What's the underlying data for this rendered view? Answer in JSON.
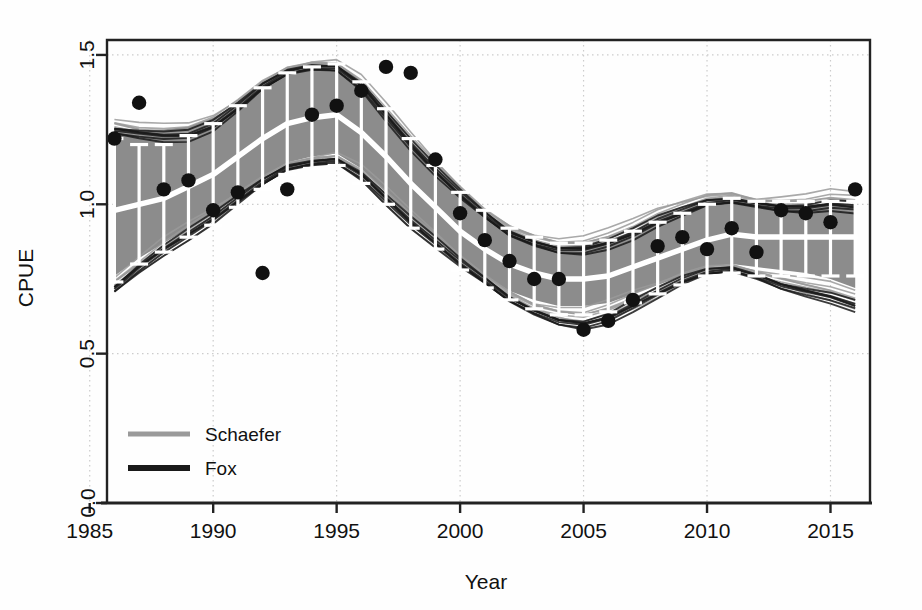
{
  "chart_data": {
    "type": "line",
    "title": "",
    "xlabel": "Year",
    "ylabel": "CPUE",
    "xlim": [
      1985.7,
      2016.6
    ],
    "ylim": [
      0.0,
      1.55
    ],
    "xticks": [
      1985,
      1990,
      1995,
      2000,
      2005,
      2010,
      2015
    ],
    "xticklabels": [
      "1985",
      "1990",
      "1995",
      "2000",
      "2005",
      "2010",
      "2015"
    ],
    "yticks": [
      0.0,
      0.5,
      1.0,
      1.5
    ],
    "yticklabels": [
      "0.0",
      "0.5",
      "1.0",
      "1.5"
    ],
    "grid": true,
    "grid_style": "dotted",
    "legend": {
      "position": "bottom-left",
      "entries": [
        {
          "label": "Schaefer",
          "color": "#9a9a9a"
        },
        {
          "label": "Fox",
          "color": "#1a1a1a"
        }
      ]
    },
    "colors": {
      "ribbon": "#8c8c8c",
      "median_line": "#ffffff",
      "errorbar": "#ffffff",
      "observed_points": "#111111",
      "schaefer": "#9a9a9a",
      "fox": "#1a1a1a",
      "axis": "#222222",
      "grid": "#cccccc"
    },
    "x": [
      1986,
      1987,
      1988,
      1989,
      1990,
      1991,
      1992,
      1993,
      1994,
      1995,
      1996,
      1997,
      1998,
      1999,
      2000,
      2001,
      2002,
      2003,
      2004,
      2005,
      2006,
      2007,
      2008,
      2009,
      2010,
      2011,
      2012,
      2013,
      2014,
      2015,
      2016
    ],
    "series": [
      {
        "name": "median",
        "role": "fitted-median",
        "values": [
          0.98,
          1.0,
          1.02,
          1.06,
          1.1,
          1.16,
          1.22,
          1.27,
          1.29,
          1.3,
          1.24,
          1.16,
          1.07,
          0.99,
          0.91,
          0.85,
          0.8,
          0.77,
          0.75,
          0.75,
          0.76,
          0.79,
          0.82,
          0.85,
          0.88,
          0.9,
          0.89,
          0.89,
          0.89,
          0.89,
          0.89
        ]
      },
      {
        "name": "ribbon_lower",
        "role": "ci-lower",
        "values": [
          0.76,
          0.82,
          0.87,
          0.92,
          0.97,
          1.03,
          1.09,
          1.14,
          1.16,
          1.17,
          1.12,
          1.04,
          0.96,
          0.89,
          0.82,
          0.76,
          0.71,
          0.68,
          0.66,
          0.66,
          0.67,
          0.7,
          0.73,
          0.76,
          0.79,
          0.8,
          0.79,
          0.78,
          0.77,
          0.75,
          0.72
        ]
      },
      {
        "name": "ribbon_upper",
        "role": "ci-upper",
        "values": [
          1.25,
          1.25,
          1.25,
          1.26,
          1.29,
          1.34,
          1.4,
          1.45,
          1.46,
          1.46,
          1.4,
          1.3,
          1.2,
          1.11,
          1.03,
          0.96,
          0.91,
          0.88,
          0.86,
          0.86,
          0.88,
          0.91,
          0.95,
          0.98,
          1.01,
          1.02,
          1.01,
          1.0,
          1.0,
          1.0,
          0.99
        ]
      },
      {
        "name": "Schaefer",
        "role": "model-envelope",
        "values": [
          1.27,
          1.25,
          1.24,
          1.24,
          1.27,
          1.33,
          1.4,
          1.45,
          1.47,
          1.47,
          1.41,
          1.31,
          1.21,
          1.12,
          1.04,
          0.97,
          0.92,
          0.89,
          0.87,
          0.87,
          0.89,
          0.92,
          0.96,
          0.99,
          1.02,
          1.03,
          1.01,
          1.01,
          1.01,
          1.02,
          1.01
        ]
      },
      {
        "name": "Fox",
        "role": "model-envelope",
        "values": [
          1.25,
          1.24,
          1.23,
          1.23,
          1.26,
          1.32,
          1.39,
          1.44,
          1.46,
          1.46,
          1.4,
          1.3,
          1.2,
          1.11,
          1.03,
          0.96,
          0.9,
          0.87,
          0.85,
          0.85,
          0.87,
          0.9,
          0.94,
          0.97,
          1.0,
          1.01,
          1.0,
          0.99,
          0.99,
          1.0,
          0.99
        ]
      },
      {
        "name": "Schaefer_lower",
        "role": "model-envelope-lower",
        "values": [
          0.74,
          0.8,
          0.86,
          0.91,
          0.96,
          1.02,
          1.08,
          1.13,
          1.15,
          1.16,
          1.11,
          1.03,
          0.95,
          0.88,
          0.81,
          0.75,
          0.7,
          0.66,
          0.64,
          0.63,
          0.65,
          0.68,
          0.71,
          0.75,
          0.78,
          0.79,
          0.77,
          0.75,
          0.73,
          0.71,
          0.68
        ]
      },
      {
        "name": "Fox_lower",
        "role": "model-envelope-lower",
        "values": [
          0.72,
          0.79,
          0.85,
          0.9,
          0.95,
          1.01,
          1.07,
          1.12,
          1.14,
          1.15,
          1.1,
          1.02,
          0.94,
          0.87,
          0.8,
          0.74,
          0.68,
          0.64,
          0.61,
          0.6,
          0.62,
          0.66,
          0.7,
          0.74,
          0.77,
          0.78,
          0.76,
          0.73,
          0.71,
          0.69,
          0.66
        ]
      }
    ],
    "errorbars": {
      "name": "median-with-95CI",
      "x": [
        1986,
        1987,
        1988,
        1989,
        1990,
        1991,
        1992,
        1993,
        1994,
        1995,
        1996,
        1997,
        1998,
        1999,
        2000,
        2001,
        2002,
        2003,
        2004,
        2005,
        2006,
        2007,
        2008,
        2009,
        2010,
        2011,
        2012,
        2013,
        2014,
        2015,
        2016
      ],
      "center": [
        0.98,
        1.0,
        1.02,
        1.06,
        1.1,
        1.16,
        1.22,
        1.27,
        1.29,
        1.3,
        1.24,
        1.16,
        1.07,
        0.99,
        0.91,
        0.85,
        0.8,
        0.77,
        0.75,
        0.75,
        0.76,
        0.79,
        0.82,
        0.85,
        0.88,
        0.9,
        0.89,
        0.89,
        0.89,
        0.89,
        0.89
      ],
      "lower": [
        0.74,
        0.8,
        0.84,
        0.89,
        0.93,
        0.99,
        1.05,
        1.1,
        1.12,
        1.13,
        1.07,
        1.0,
        0.92,
        0.85,
        0.78,
        0.72,
        0.68,
        0.65,
        0.63,
        0.63,
        0.64,
        0.67,
        0.7,
        0.73,
        0.76,
        0.77,
        0.76,
        0.76,
        0.76,
        0.76,
        0.76
      ],
      "upper": [
        1.22,
        1.2,
        1.2,
        1.23,
        1.27,
        1.33,
        1.39,
        1.44,
        1.46,
        1.47,
        1.41,
        1.32,
        1.22,
        1.13,
        1.04,
        0.98,
        0.92,
        0.89,
        0.87,
        0.87,
        0.88,
        0.91,
        0.94,
        0.97,
        1.0,
        1.02,
        1.01,
        1.01,
        1.01,
        1.01,
        1.01
      ]
    },
    "observed": {
      "name": "observed CPUE",
      "marker": "filled-circle",
      "points": [
        {
          "x": 1986,
          "y": 1.22
        },
        {
          "x": 1987,
          "y": 1.34
        },
        {
          "x": 1988,
          "y": 1.05
        },
        {
          "x": 1989,
          "y": 1.08
        },
        {
          "x": 1990,
          "y": 0.98
        },
        {
          "x": 1991,
          "y": 1.04
        },
        {
          "x": 1992,
          "y": 0.77
        },
        {
          "x": 1993,
          "y": 1.05
        },
        {
          "x": 1994,
          "y": 1.3
        },
        {
          "x": 1995,
          "y": 1.33
        },
        {
          "x": 1996,
          "y": 1.38
        },
        {
          "x": 1997,
          "y": 1.46
        },
        {
          "x": 1998,
          "y": 1.44
        },
        {
          "x": 1999,
          "y": 1.15
        },
        {
          "x": 2000,
          "y": 0.97
        },
        {
          "x": 2001,
          "y": 0.88
        },
        {
          "x": 2002,
          "y": 0.81
        },
        {
          "x": 2003,
          "y": 0.75
        },
        {
          "x": 2004,
          "y": 0.75
        },
        {
          "x": 2005,
          "y": 0.58
        },
        {
          "x": 2006,
          "y": 0.61
        },
        {
          "x": 2007,
          "y": 0.68
        },
        {
          "x": 2008,
          "y": 0.86
        },
        {
          "x": 2009,
          "y": 0.89
        },
        {
          "x": 2010,
          "y": 0.85
        },
        {
          "x": 2011,
          "y": 0.92
        },
        {
          "x": 2012,
          "y": 0.84
        },
        {
          "x": 2013,
          "y": 0.98
        },
        {
          "x": 2014,
          "y": 0.97
        },
        {
          "x": 2015,
          "y": 0.94
        },
        {
          "x": 2016,
          "y": 1.05
        }
      ]
    }
  }
}
